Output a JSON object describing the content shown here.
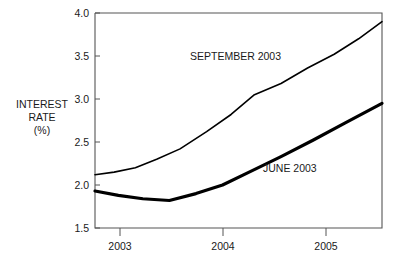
{
  "chart_data": {
    "type": "line",
    "title": "",
    "subtitle": "",
    "xlabel": "",
    "ylabel": "INTEREST RATE (%)",
    "ylabel_lines": [
      "INTEREST",
      "RATE",
      "(%)"
    ],
    "xlim": [
      2002.8,
      2005.5
    ],
    "ylim": [
      1.5,
      4.0
    ],
    "grid": false,
    "legend_position": "inline-annotations",
    "y_ticks": [
      1.5,
      2.0,
      2.5,
      3.0,
      3.5,
      4.0
    ],
    "y_tick_labels": [
      "1.5",
      "2.0",
      "2.5",
      "3.0",
      "3.5",
      "4.0"
    ],
    "x_ticks": [
      2003,
      2004,
      2005
    ],
    "x_tick_labels": [
      "2003",
      "2004",
      "2005"
    ],
    "series": [
      {
        "name": "SEPTEMBER 2003",
        "label": "SEPTEMBER 2003",
        "line_width": 1.6,
        "color": "#000000",
        "x": [
          2002.8,
          2002.98,
          2003.18,
          2003.38,
          2003.6,
          2003.85,
          2004.08,
          2004.3,
          2004.55,
          2004.8,
          2005.05,
          2005.28,
          2005.5
        ],
        "y": [
          2.12,
          2.15,
          2.2,
          2.3,
          2.42,
          2.62,
          2.82,
          3.05,
          3.18,
          3.36,
          3.52,
          3.7,
          3.9
        ]
      },
      {
        "name": "JUNE 2003",
        "label": "JUNE 2003",
        "line_width": 3.2,
        "color": "#000000",
        "x": [
          2002.8,
          2003.02,
          2003.25,
          2003.5,
          2003.75,
          2004.0,
          2004.25,
          2004.55,
          2004.85,
          2005.15,
          2005.5
        ],
        "y": [
          1.93,
          1.88,
          1.84,
          1.82,
          1.9,
          2.0,
          2.15,
          2.33,
          2.52,
          2.72,
          2.95
        ]
      }
    ],
    "annotations": [
      {
        "text": "SEPTEMBER 2003",
        "x_px": 190,
        "y_px": 60
      },
      {
        "text": "JUNE 2003",
        "x_px": 263,
        "y_px": 172
      }
    ]
  }
}
